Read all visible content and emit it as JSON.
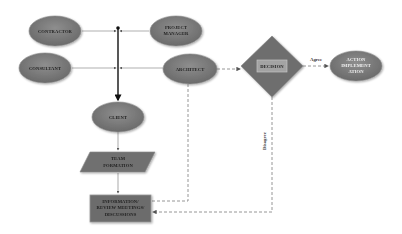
{
  "diagram": {
    "colors": {
      "node_fill": "#7a7a7a",
      "node_fill_dark": "#5e5e5e",
      "node_stroke": "#8c8c8c",
      "line": "#6e6e6e",
      "bus_line": "#1a1a1a",
      "dashed_line": "#8a8a8a",
      "decision_inner": "#9a9a9a"
    },
    "nodes": {
      "contractor": {
        "label": "CONTRACTOR",
        "shape": "ellipse"
      },
      "project_manager": {
        "label_line1": "PROJECT",
        "label_line2": "MANAGER",
        "shape": "ellipse"
      },
      "consultant": {
        "label": "CONSULTANT",
        "shape": "ellipse"
      },
      "architect": {
        "label": "ARCHITECT",
        "shape": "ellipse"
      },
      "client": {
        "label": "CLIENT",
        "shape": "ellipse"
      },
      "team_formation": {
        "label_line1": "TEAM",
        "label_line2": "FORMATION",
        "shape": "parallelogram"
      },
      "information_review": {
        "label_line1": "INFORMATION/",
        "label_line2": "REVIEW MEETINGS/",
        "label_line3": "DISCUSSIONS",
        "shape": "rectangle"
      },
      "decision": {
        "label": "DECISION",
        "shape": "diamond"
      },
      "action_implementation": {
        "label_line1": "ACTION",
        "label_line2": "IMPLEMENT",
        "label_line3": "ATION",
        "shape": "ellipse"
      }
    },
    "edges": {
      "agree": {
        "label": "Agree",
        "from": "decision",
        "to": "action_implementation",
        "style": "dashed"
      },
      "disagree": {
        "label": "Disagree",
        "from": "decision",
        "to": "information_review",
        "style": "dashed"
      },
      "architect_to_decision": {
        "from": "architect",
        "to": "decision",
        "style": "dashed"
      },
      "architect_to_review": {
        "from": "architect",
        "to": "information_review",
        "style": "dashed"
      },
      "bus_to_client": {
        "from": "stakeholder-bus",
        "to": "client",
        "style": "solid-bold"
      },
      "client_to_team": {
        "from": "client",
        "to": "team_formation",
        "style": "solid"
      },
      "team_to_review": {
        "from": "team_formation",
        "to": "information_review",
        "style": "solid"
      }
    }
  }
}
